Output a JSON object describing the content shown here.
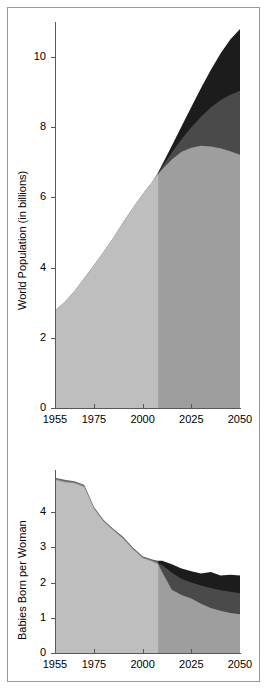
{
  "figure": {
    "panels": [
      {
        "id": "population",
        "name": "world-population-chart"
      },
      {
        "id": "fertility",
        "name": "fertility-rate-chart"
      }
    ]
  },
  "chart_data": [
    {
      "type": "area",
      "id": "population",
      "title": "",
      "xlabel": "",
      "ylabel": "World Population (in billions)",
      "xlim": [
        1955,
        2050
      ],
      "ylim": [
        0,
        11
      ],
      "xticks": [
        1955,
        1975,
        2000,
        2025,
        2050
      ],
      "xticklabels": [
        "1955",
        "1975",
        "2000",
        "2025",
        "2050"
      ],
      "yticks": [
        0,
        2,
        4,
        6,
        8,
        10
      ],
      "yticklabels": [
        "0",
        "2",
        "4",
        "6",
        "8",
        "10"
      ],
      "grid": false,
      "legend": "none",
      "projection_start": 2008,
      "stacking": "overlaid-bands",
      "x": [
        1955,
        1960,
        1965,
        1970,
        1975,
        1980,
        1985,
        1990,
        1995,
        2000,
        2005,
        2008,
        2010,
        2015,
        2020,
        2025,
        2030,
        2035,
        2040,
        2045,
        2050
      ],
      "series": [
        {
          "name": "Low variant",
          "color": "#9e9e9e",
          "values": [
            2.77,
            3.02,
            3.33,
            3.7,
            4.07,
            4.45,
            4.85,
            5.29,
            5.7,
            6.09,
            6.45,
            6.67,
            6.8,
            7.08,
            7.3,
            7.42,
            7.47,
            7.45,
            7.4,
            7.32,
            7.22
          ]
        },
        {
          "name": "Medium variant",
          "color": "#4a4a4a",
          "values": [
            2.77,
            3.02,
            3.33,
            3.7,
            4.07,
            4.45,
            4.85,
            5.29,
            5.7,
            6.09,
            6.45,
            6.7,
            6.87,
            7.28,
            7.66,
            8.0,
            8.3,
            8.56,
            8.77,
            8.93,
            9.04
          ]
        },
        {
          "name": "High variant",
          "color": "#1c1c1c",
          "values": [
            2.77,
            3.02,
            3.33,
            3.7,
            4.07,
            4.45,
            4.85,
            5.29,
            5.7,
            6.09,
            6.45,
            6.72,
            6.93,
            7.47,
            8.03,
            8.58,
            9.12,
            9.63,
            10.1,
            10.5,
            10.8
          ]
        }
      ]
    },
    {
      "type": "area",
      "id": "fertility",
      "title": "",
      "xlabel": "",
      "ylabel": "Babies Born  per Woman",
      "xlim": [
        1955,
        2050
      ],
      "ylim": [
        0,
        5.2
      ],
      "xticks": [
        1955,
        1975,
        2000,
        2025,
        2050
      ],
      "xticklabels": [
        "1955",
        "1975",
        "2000",
        "2025",
        "2050"
      ],
      "yticks": [
        0,
        1,
        2,
        3,
        4
      ],
      "yticklabels": [
        "0",
        "1",
        "2",
        "3",
        "4"
      ],
      "grid": false,
      "legend": "none",
      "projection_start": 2008,
      "stacking": "overlaid-bands",
      "x": [
        1955,
        1960,
        1965,
        1970,
        1975,
        1980,
        1985,
        1990,
        1995,
        2000,
        2005,
        2008,
        2010,
        2015,
        2020,
        2025,
        2030,
        2035,
        2040,
        2045,
        2050
      ],
      "series": [
        {
          "name": "Low variant",
          "color": "#9e9e9e",
          "values": [
            4.92,
            4.85,
            4.82,
            4.72,
            4.1,
            3.73,
            3.48,
            3.25,
            2.95,
            2.7,
            2.6,
            2.52,
            2.3,
            1.8,
            1.65,
            1.55,
            1.4,
            1.28,
            1.2,
            1.14,
            1.1
          ]
        },
        {
          "name": "Medium variant",
          "color": "#4a4a4a",
          "values": [
            4.95,
            4.88,
            4.85,
            4.75,
            4.12,
            3.75,
            3.5,
            3.27,
            2.97,
            2.72,
            2.62,
            2.55,
            2.5,
            2.28,
            2.1,
            2.0,
            1.92,
            1.85,
            1.78,
            1.74,
            1.7
          ]
        },
        {
          "name": "High variant",
          "color": "#1c1c1c",
          "values": [
            4.98,
            4.92,
            4.88,
            4.78,
            4.15,
            3.78,
            3.52,
            3.3,
            3.0,
            2.75,
            2.66,
            2.62,
            2.62,
            2.52,
            2.4,
            2.32,
            2.26,
            2.3,
            2.2,
            2.22,
            2.2
          ]
        }
      ]
    }
  ]
}
